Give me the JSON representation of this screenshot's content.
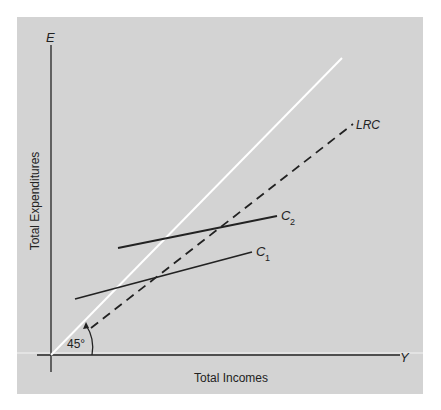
{
  "figure": {
    "axes": {
      "y_axis_symbol": "E",
      "x_axis_symbol": "Y",
      "y_axis_label": "Total Expenditures",
      "x_axis_label": "Total Incomes"
    },
    "angle_label": "45°",
    "curves": [
      {
        "id": "line-45",
        "label": "",
        "style": "solid-white",
        "description": "45-degree line"
      },
      {
        "id": "lrc",
        "label": "LRC",
        "style": "dashed"
      },
      {
        "id": "c1",
        "label": "C",
        "subscript": "1",
        "style": "solid"
      },
      {
        "id": "c2",
        "label": "C",
        "subscript": "2",
        "style": "solid"
      }
    ],
    "colors": {
      "panel": "#d3d3d3",
      "axis": "#222222",
      "line_45": "#ffffff"
    }
  }
}
